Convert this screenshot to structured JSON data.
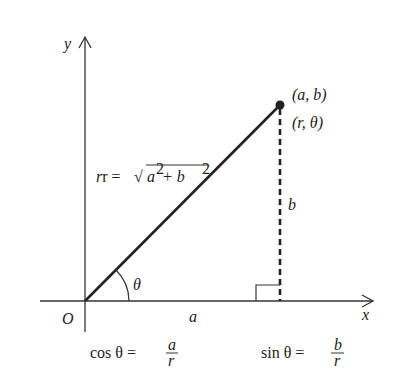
{
  "diagram": {
    "axes": {
      "x_label": "x",
      "y_label": "y",
      "origin_label": "O"
    },
    "point": {
      "cartesian_label": "(a, b)",
      "polar_label": "(r, θ)"
    },
    "segments": {
      "horizontal_label": "a",
      "vertical_label": "b",
      "radius_label_prefix": "r = ",
      "radius_label_sqrt": "√",
      "radius_label_expr_a": "a",
      "radius_label_expr_plus": " + b",
      "radius_label_exp": "2"
    },
    "angle_label": "θ",
    "formulas": {
      "cos": {
        "lhs": "cos θ = ",
        "numerator": "a",
        "denominator": "r"
      },
      "sin": {
        "lhs": "sin θ = ",
        "numerator": "b",
        "denominator": "r"
      }
    },
    "colors": {
      "stroke": "#222222",
      "background": "#ffffff"
    }
  }
}
